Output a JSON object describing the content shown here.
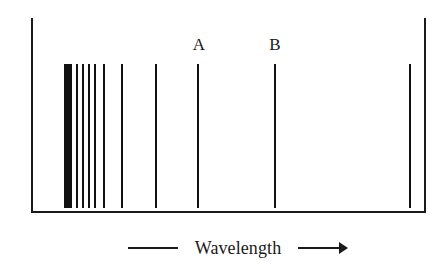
{
  "figure": {
    "background_color": "#ffffff",
    "line_color": "#111111",
    "frame_color": "#1a1a1a"
  },
  "frame": {
    "left_border": {
      "x": 31,
      "y_top": 18,
      "y_bottom": 211,
      "thickness": 2
    },
    "right_border": {
      "x": 424,
      "y_top": 18,
      "y_bottom": 211,
      "thickness": 2
    },
    "bottom_axis": {
      "y": 211,
      "x_start": 31,
      "x_end": 426,
      "thickness": 2
    }
  },
  "axis_caption": {
    "label": "Wavelength",
    "left_rule": {
      "x": 128,
      "width": 50
    },
    "right_rule": {
      "x": 298,
      "width": 44
    },
    "arrow_direction": "right",
    "arrow_tip_x": 348,
    "baseline_y": 248
  },
  "markers": [
    {
      "id": "marker-a",
      "label": "A",
      "x": 199,
      "label_y": 36,
      "line_index": 7
    },
    {
      "id": "marker-b",
      "label": "B",
      "x": 275,
      "label_y": 36,
      "line_index": 8
    }
  ],
  "chart_data": {
    "type": "line-spectrum",
    "title": "",
    "xlabel": "Wavelength",
    "ylabel": "",
    "grid": false,
    "legend": null,
    "axis_direction": "increasing wavelength to the right",
    "line_top_y": 64,
    "line_bottom_y": 208,
    "x_domain_px": [
      31,
      424
    ],
    "annotations": [
      "A",
      "B"
    ],
    "lines": [
      {
        "index": 0,
        "x": 64,
        "width": 8,
        "kind": "band",
        "label": ""
      },
      {
        "index": 1,
        "x": 76,
        "width": 2,
        "kind": "line",
        "label": ""
      },
      {
        "index": 2,
        "x": 82,
        "width": 2,
        "kind": "line",
        "label": ""
      },
      {
        "index": 3,
        "x": 88,
        "width": 2,
        "kind": "line",
        "label": ""
      },
      {
        "index": 4,
        "x": 94,
        "width": 2,
        "kind": "line",
        "label": ""
      },
      {
        "index": 5,
        "x": 103,
        "width": 2,
        "kind": "line",
        "label": ""
      },
      {
        "index": 6,
        "x": 121,
        "width": 2,
        "kind": "line",
        "label": ""
      },
      {
        "index": 7,
        "x": 155,
        "width": 2,
        "kind": "line",
        "label": ""
      },
      {
        "index": 8,
        "x": 197,
        "width": 2,
        "kind": "line",
        "label": "A"
      },
      {
        "index": 9,
        "x": 274,
        "width": 2,
        "kind": "line",
        "label": "B"
      },
      {
        "index": 10,
        "x": 409,
        "width": 2,
        "kind": "line",
        "label": ""
      }
    ],
    "series": [
      {
        "name": "spectral lines",
        "x_px": [
          64,
          76,
          82,
          88,
          94,
          103,
          121,
          155,
          197,
          274,
          409
        ],
        "widths_px": [
          8,
          2,
          2,
          2,
          2,
          2,
          2,
          2,
          2,
          2,
          2
        ]
      }
    ]
  }
}
